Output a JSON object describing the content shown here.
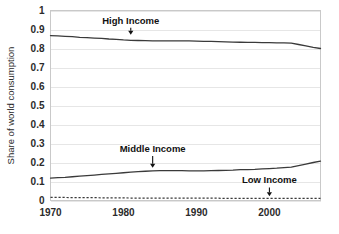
{
  "chart_data": {
    "type": "line",
    "title": "",
    "subtitle": "",
    "xlabel": "",
    "ylabel": "Share of world consumption",
    "xlim": [
      1970,
      2007
    ],
    "ylim": [
      0,
      1
    ],
    "grid": true,
    "legend_position": "inline-annotations",
    "x_ticks": [
      "1970",
      "1980",
      "1990",
      "2000"
    ],
    "x_tick_values": [
      1970,
      1980,
      1990,
      2000
    ],
    "y_ticks": [
      "0",
      "0.1",
      "0.2",
      "0.3",
      "0.4",
      "0.5",
      "0.6",
      "0.7",
      "0.8",
      "0.9",
      "1"
    ],
    "y_tick_values": [
      0,
      0.1,
      0.2,
      0.3,
      0.4,
      0.5,
      0.6,
      0.7,
      0.8,
      0.9,
      1
    ],
    "x": [
      1970,
      1971,
      1972,
      1973,
      1974,
      1975,
      1976,
      1977,
      1978,
      1979,
      1980,
      1981,
      1982,
      1983,
      1984,
      1985,
      1986,
      1987,
      1988,
      1989,
      1990,
      1991,
      1992,
      1993,
      1994,
      1995,
      1996,
      1997,
      1998,
      1999,
      2000,
      2001,
      2002,
      2003,
      2004,
      2005,
      2006,
      2007
    ],
    "series": [
      {
        "name": "High Income",
        "style": "solid",
        "color": "#3a3a3a",
        "values": [
          0.868,
          0.866,
          0.864,
          0.862,
          0.859,
          0.857,
          0.855,
          0.853,
          0.85,
          0.848,
          0.845,
          0.843,
          0.842,
          0.841,
          0.84,
          0.84,
          0.84,
          0.84,
          0.84,
          0.84,
          0.839,
          0.838,
          0.837,
          0.836,
          0.835,
          0.834,
          0.833,
          0.832,
          0.832,
          0.831,
          0.831,
          0.83,
          0.83,
          0.828,
          0.821,
          0.814,
          0.806,
          0.8
        ]
      },
      {
        "name": "Middle Income",
        "style": "solid",
        "color": "#3a3a3a",
        "values": [
          0.118,
          0.12,
          0.122,
          0.125,
          0.128,
          0.131,
          0.134,
          0.137,
          0.14,
          0.143,
          0.146,
          0.149,
          0.152,
          0.154,
          0.156,
          0.157,
          0.157,
          0.157,
          0.157,
          0.156,
          0.156,
          0.156,
          0.157,
          0.158,
          0.159,
          0.16,
          0.162,
          0.163,
          0.164,
          0.166,
          0.168,
          0.17,
          0.173,
          0.176,
          0.184,
          0.192,
          0.2,
          0.207
        ]
      },
      {
        "name": "Low Income",
        "style": "dashed",
        "color": "#3a3a3a",
        "values": [
          0.016,
          0.016,
          0.016,
          0.015,
          0.015,
          0.015,
          0.015,
          0.014,
          0.014,
          0.014,
          0.014,
          0.013,
          0.013,
          0.013,
          0.013,
          0.013,
          0.012,
          0.012,
          0.012,
          0.012,
          0.012,
          0.012,
          0.012,
          0.012,
          0.011,
          0.011,
          0.011,
          0.011,
          0.011,
          0.011,
          0.011,
          0.011,
          0.011,
          0.011,
          0.011,
          0.011,
          0.011,
          0.011
        ]
      }
    ],
    "annotations": [
      {
        "text": "High Income",
        "x": 1981,
        "y": 0.93,
        "arrow_to_y": 0.875
      },
      {
        "text": "Middle Income",
        "x": 1984,
        "y": 0.255,
        "arrow_to_y": 0.175
      },
      {
        "text": "Low Income",
        "x": 2000,
        "y": 0.09,
        "arrow_to_y": 0.025
      }
    ]
  },
  "colors": {
    "background": "#ffffff",
    "line": "#3a3a3a",
    "grid": "#e6e6e6",
    "border": "#c9c9c9",
    "text": "#2b2b2b"
  }
}
